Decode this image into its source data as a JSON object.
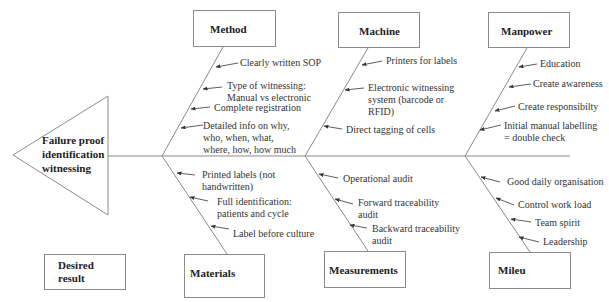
{
  "effect": {
    "lines": [
      "Failure proof",
      "identification",
      "witnessing"
    ]
  },
  "legend": {
    "desired_result_lines": [
      "Desired",
      "result"
    ]
  },
  "categories": {
    "method": {
      "label": "Method",
      "causes": [
        {
          "lines": [
            "Clearly written SOP"
          ]
        },
        {
          "lines": [
            "Type of witnessing:",
            "Manual vs electronic"
          ]
        },
        {
          "lines": [
            "Complete registration"
          ]
        },
        {
          "lines": [
            "Detailed info on why,",
            "who, when, what,",
            "where, how, how much"
          ]
        }
      ]
    },
    "machine": {
      "label": "Machine",
      "causes": [
        {
          "lines": [
            "Printers for labels"
          ]
        },
        {
          "lines": [
            "Electronic witnessing",
            "system (barcode or",
            "RFID)"
          ]
        },
        {
          "lines": [
            "Direct tagging of cells"
          ]
        }
      ]
    },
    "manpower": {
      "label": "Manpower",
      "causes": [
        {
          "lines": [
            "Education"
          ]
        },
        {
          "lines": [
            "Create awareness"
          ]
        },
        {
          "lines": [
            "Create responsibilty"
          ]
        },
        {
          "lines": [
            "Initial manual labelling",
            "= double check"
          ]
        }
      ]
    },
    "materials": {
      "label": "Materials",
      "causes": [
        {
          "lines": [
            "Printed labels (not",
            "handwritten)"
          ]
        },
        {
          "lines": [
            "Full identification:",
            "patients and cycle"
          ]
        },
        {
          "lines": [
            "Label before culture"
          ]
        }
      ]
    },
    "measurements": {
      "label": "Measurements",
      "causes": [
        {
          "lines": [
            "Operational audit"
          ]
        },
        {
          "lines": [
            "Forward traceability",
            "audit"
          ]
        },
        {
          "lines": [
            "Backward traceability",
            "audit"
          ]
        }
      ]
    },
    "mileu": {
      "label": "Mileu",
      "causes": [
        {
          "lines": [
            "Good daily organisation"
          ]
        },
        {
          "lines": [
            "Control work load"
          ]
        },
        {
          "lines": [
            "Team spirit"
          ]
        },
        {
          "lines": [
            "Leadership"
          ]
        }
      ]
    }
  },
  "colors": {
    "line": "#8a8a8a",
    "arrow": "#333333",
    "text": "#222222"
  }
}
